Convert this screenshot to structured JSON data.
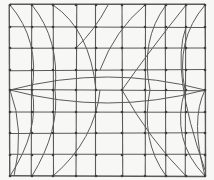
{
  "title": "Hand-drawn pencil grid sketch with curved distortion lines",
  "canvas": {
    "width": 214,
    "height": 180,
    "background": "#f7f7f5",
    "stroke": "#5a5a5a",
    "dot": "#3c3c3c"
  },
  "frame": {
    "x0": 10,
    "y0": 5,
    "x1": 205,
    "y1": 176
  },
  "vertical_lines_x": [
    10,
    32,
    53,
    76,
    96,
    122,
    145,
    166,
    186,
    205
  ],
  "horizontal_lines_y": [
    5,
    27,
    48,
    70,
    90,
    112,
    133,
    155,
    176
  ],
  "lens": {
    "y": 90,
    "x0": 10,
    "x1": 205,
    "top_y": 77,
    "bottom_y": 103
  },
  "curves": [
    {
      "name": "top-left-arc-1",
      "d": "M10 5 Q 40 40 32 90"
    },
    {
      "name": "top-left-arc-2",
      "d": "M32 5 Q 60 40 55 90"
    },
    {
      "name": "top-left-diag",
      "d": "M53 5 Q 90 30 96 90"
    },
    {
      "name": "top-right-arc-1",
      "d": "M205 5 Q 175 40 185 90"
    },
    {
      "name": "top-right-arc-2",
      "d": "M166 5 Q 140 40 150 90"
    },
    {
      "name": "top-right-diag",
      "d": "M186 5 Q 150 50 122 90"
    },
    {
      "name": "top-mid-diag",
      "d": "M145 5 Q 115 30 100 70"
    },
    {
      "name": "top-center-arc",
      "d": "M76 48 Q 95 30 108 5"
    },
    {
      "name": "bottom-left-arc-1",
      "d": "M10 176 Q 40 130 32 90"
    },
    {
      "name": "bottom-left-arc-2",
      "d": "M32 176 Q 60 130 55 90"
    },
    {
      "name": "bottom-left-diag",
      "d": "M10 90 Q 25 130 14 176"
    },
    {
      "name": "bottom-left-curve",
      "d": "M53 176 Q 95 140 100 90"
    },
    {
      "name": "bottom-right-arc-1",
      "d": "M205 176 Q 170 140 185 90"
    },
    {
      "name": "bottom-right-arc-2",
      "d": "M166 176 Q 140 140 150 90"
    },
    {
      "name": "bottom-right-diag",
      "d": "M186 176 Q 150 140 122 90"
    },
    {
      "name": "bottom-right-corner",
      "d": "M205 90 Q 190 120 205 176"
    },
    {
      "name": "mid-right-diag",
      "d": "M186 27 Q 170 70 205 170"
    }
  ]
}
